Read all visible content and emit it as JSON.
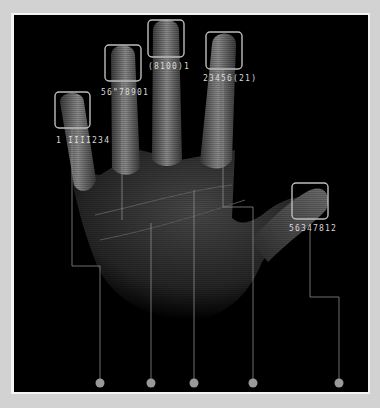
{
  "image": {
    "description": "X-ray style hand with highlighted fingertips and code labels",
    "colors": {
      "background": "#d2d2d2",
      "frame": "#f4f4f4",
      "panel": "#000000",
      "box_stroke": "#bdbdbd",
      "line_stroke": "#8a8a8a",
      "dot_fill": "#9a9a9a",
      "label_text": "#d8d8d8"
    }
  },
  "fingers": [
    {
      "name": "pinky",
      "label": "1 IIII234"
    },
    {
      "name": "ring",
      "label": "56\"78901"
    },
    {
      "name": "middle",
      "label": "(8100)1"
    },
    {
      "name": "index",
      "label": "23456(21)"
    },
    {
      "name": "thumb",
      "label": "56347812"
    }
  ],
  "dots": [
    {
      "finger": "pinky"
    },
    {
      "finger": "ring"
    },
    {
      "finger": "middle"
    },
    {
      "finger": "index"
    },
    {
      "finger": "thumb"
    }
  ]
}
